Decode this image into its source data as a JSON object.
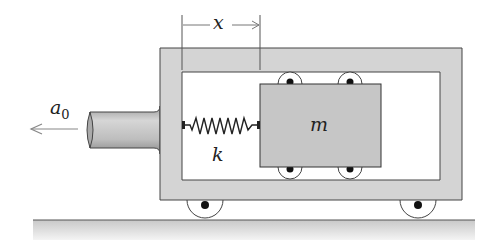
{
  "diagram": {
    "labels": {
      "displacement": "x",
      "acceleration": "a",
      "acceleration_sub": "0",
      "spring_constant": "k",
      "mass": "m"
    },
    "colors": {
      "frame_fill": "#d4d4d4",
      "mass_fill": "#c6c6c6",
      "rod_fill": "#bdbdbd",
      "ground_fill": "#d0d0d0",
      "stroke": "#333333",
      "arrow": "#888888"
    }
  }
}
